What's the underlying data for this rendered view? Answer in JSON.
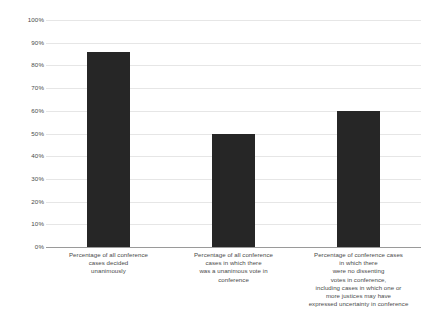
{
  "chart_data": {
    "type": "bar",
    "title": "",
    "subtitle": "",
    "xlabel": "",
    "ylabel": "",
    "ylim": [
      0,
      100
    ],
    "grid": true,
    "legend": "none",
    "categories": [
      "Percentage of all conference cases decided unanimously",
      "Percentage of all conference cases in which there was a unanimous vote in conference",
      "Percentage of conference cases in which there were no dissenting votes in conference, including cases in which one or more justices may have expressed uncertainty in conference"
    ],
    "category_lines": [
      [
        "Percentage of all conference",
        "cases decided",
        "unanimously"
      ],
      [
        "Percentage of all conference",
        "cases in which there",
        "was a unanimous vote in",
        "conference"
      ],
      [
        "Percentage of conference cases",
        "in which there",
        "were no dissenting",
        "votes in conference,",
        "including cases in which one or",
        "more justices may have",
        "expressed uncertainty in conference"
      ]
    ],
    "values": [
      86,
      50,
      60
    ],
    "value_unit": "%",
    "bar_color": "#262626",
    "grid_color": "#e6e6e6",
    "axis_color": "#9a9a9a",
    "background_color": "#ffffff",
    "yticks": [
      {
        "value": 100,
        "label": "100%"
      },
      {
        "value": 90,
        "label": "90%"
      },
      {
        "value": 80,
        "label": "80%"
      },
      {
        "value": 70,
        "label": "70%"
      },
      {
        "value": 60,
        "label": "60%"
      },
      {
        "value": 50,
        "label": "50%"
      },
      {
        "value": 40,
        "label": "40%"
      },
      {
        "value": 30,
        "label": "30%"
      },
      {
        "value": 20,
        "label": "20%"
      },
      {
        "value": 10,
        "label": "10%"
      },
      {
        "value": 0,
        "label": "0%"
      }
    ]
  }
}
